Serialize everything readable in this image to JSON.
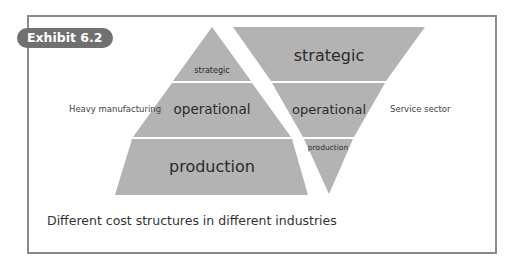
{
  "exhibit": {
    "badge_label": "Exhibit 6.2",
    "caption": "Different cost structures in different industries"
  },
  "colors": {
    "shape_fill": "#b3b3b3",
    "frame_border": "#8a8a8a",
    "badge_bg": "#707070"
  },
  "pyramid": {
    "label": "Heavy manufacturing",
    "layers": [
      {
        "name": "strategic",
        "label": "strategic"
      },
      {
        "name": "operational",
        "label": "operational"
      },
      {
        "name": "production",
        "label": "production"
      }
    ]
  },
  "inverted_pyramid": {
    "label": "Service sector",
    "layers": [
      {
        "name": "strategic",
        "label": "strategic"
      },
      {
        "name": "operational",
        "label": "operational"
      },
      {
        "name": "production",
        "label": "production"
      }
    ]
  }
}
